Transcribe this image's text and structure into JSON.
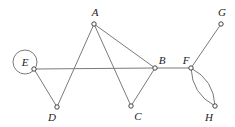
{
  "diagram": {
    "type": "graph",
    "nodes": [
      {
        "id": "A",
        "label": "A",
        "x": 94,
        "y": 24,
        "lx": 95,
        "ly": 16
      },
      {
        "id": "B",
        "label": "B",
        "x": 155,
        "y": 68,
        "lx": 162,
        "ly": 64
      },
      {
        "id": "C",
        "label": "C",
        "x": 131,
        "y": 106,
        "lx": 138,
        "ly": 120
      },
      {
        "id": "D",
        "label": "D",
        "x": 57,
        "y": 107,
        "lx": 52,
        "ly": 121
      },
      {
        "id": "E",
        "label": "E",
        "x": 34,
        "y": 69,
        "lx": 25,
        "ly": 66
      },
      {
        "id": "F",
        "label": "F",
        "x": 191,
        "y": 68,
        "lx": 186,
        "ly": 64
      },
      {
        "id": "G",
        "label": "G",
        "x": 221,
        "y": 24,
        "lx": 222,
        "ly": 16
      },
      {
        "id": "H",
        "label": "H",
        "x": 215,
        "y": 106,
        "lx": 209,
        "ly": 121
      }
    ],
    "edges": [
      {
        "from": "A",
        "to": "D"
      },
      {
        "from": "A",
        "to": "C"
      },
      {
        "from": "A",
        "to": "B"
      },
      {
        "from": "E",
        "to": "D"
      },
      {
        "from": "E",
        "to": "B"
      },
      {
        "from": "B",
        "to": "C"
      },
      {
        "from": "B",
        "to": "F"
      },
      {
        "from": "F",
        "to": "G"
      },
      {
        "from": "F",
        "to": "H",
        "curve": "left"
      },
      {
        "from": "F",
        "to": "H",
        "curve": "right"
      }
    ],
    "loops": [
      {
        "node": "E",
        "cx": 25,
        "cy": 62,
        "r": 12
      }
    ]
  }
}
